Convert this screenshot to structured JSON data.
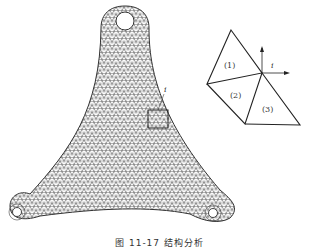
{
  "figure": {
    "caption": "图 11-17  结构分析",
    "main_part": {
      "description": "triangular bracket with finite element triangular mesh",
      "holes": 3,
      "zoom_box_label": "i"
    },
    "inset": {
      "node_label": "i",
      "elements": [
        {
          "label": "(1)"
        },
        {
          "label": "(2)"
        },
        {
          "label": "(3)"
        }
      ],
      "axes": [
        "x-arrow",
        "y-arrow"
      ]
    },
    "colors": {
      "line": "#333333",
      "mesh": "#555555",
      "background": "#ffffff"
    }
  }
}
